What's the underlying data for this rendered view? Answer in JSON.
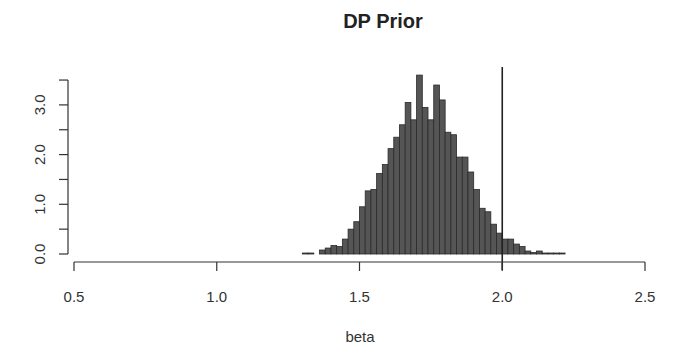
{
  "chart_data": {
    "type": "bar",
    "subtype": "histogram",
    "title": "DP Prior",
    "xlabel": "beta",
    "ylabel": "",
    "xlim": [
      0.5,
      2.5
    ],
    "ylim": [
      0,
      3.5
    ],
    "x_ticks": [
      "0.5",
      "1.0",
      "1.5",
      "2.0",
      "2.5"
    ],
    "x_tick_values": [
      0.5,
      1.0,
      1.5,
      2.0,
      2.5
    ],
    "y_ticks": [
      "0.0",
      "1.0",
      "2.0",
      "3.0"
    ],
    "y_tick_values": [
      0.0,
      0.5,
      1.0,
      1.5,
      2.0,
      2.5,
      3.0,
      3.5
    ],
    "y_labeled_ticks": [
      0.0,
      1.0,
      2.0,
      3.0
    ],
    "bin_width": 0.02,
    "bin_start": 1.3,
    "categories": [
      "1.30",
      "1.32",
      "1.34",
      "1.36",
      "1.38",
      "1.40",
      "1.42",
      "1.44",
      "1.46",
      "1.48",
      "1.50",
      "1.52",
      "1.54",
      "1.56",
      "1.58",
      "1.60",
      "1.62",
      "1.64",
      "1.66",
      "1.68",
      "1.70",
      "1.72",
      "1.74",
      "1.76",
      "1.78",
      "1.80",
      "1.82",
      "1.84",
      "1.86",
      "1.88",
      "1.90",
      "1.92",
      "1.94",
      "1.96",
      "1.98",
      "2.00",
      "2.02",
      "2.04",
      "2.06",
      "2.08",
      "2.10",
      "2.12",
      "2.14",
      "2.16",
      "2.18",
      "2.20"
    ],
    "values": [
      0.02,
      0.02,
      0.0,
      0.08,
      0.12,
      0.17,
      0.15,
      0.3,
      0.5,
      0.65,
      0.95,
      1.27,
      1.3,
      1.62,
      1.8,
      2.12,
      2.35,
      2.6,
      3.05,
      2.7,
      3.6,
      2.95,
      2.7,
      3.4,
      3.1,
      2.45,
      2.4,
      1.95,
      1.95,
      1.65,
      1.3,
      0.92,
      0.85,
      0.6,
      0.42,
      0.3,
      0.3,
      0.2,
      0.15,
      0.06,
      0.03,
      0.06,
      0.02,
      0.02,
      0.02,
      0.02
    ],
    "reference_line": {
      "x": 2.0,
      "orientation": "vertical"
    },
    "grid": false,
    "legend": null
  }
}
